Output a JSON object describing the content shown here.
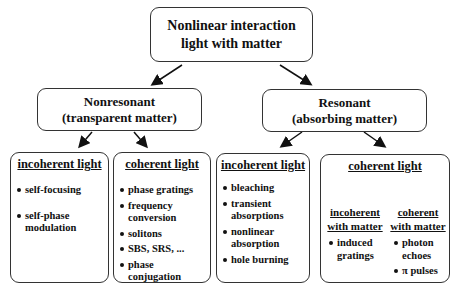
{
  "root": {
    "line1": "Nonlinear interaction",
    "line2": "light with matter"
  },
  "nonresonant": {
    "line1": "Nonresonant",
    "line2": "(transparent matter)"
  },
  "resonant": {
    "line1": "Resonant",
    "line2": "(absorbing matter)"
  },
  "nr_incoherent": {
    "title": "incoherent light",
    "items": [
      "self-focusing",
      "self-phase modulation"
    ]
  },
  "nr_coherent": {
    "title": "coherent light",
    "items": [
      "phase gratings",
      "frequency conversion",
      "solitons",
      "SBS, SRS, ...",
      "phase conjugation"
    ]
  },
  "r_incoherent": {
    "title": "incoherent light",
    "items": [
      "bleaching",
      "transient absorptions",
      "nonlinear absorption",
      "hole burning"
    ]
  },
  "r_coherent": {
    "title": "coherent light",
    "left": {
      "line1": "incoherent",
      "line2": "with matter",
      "items": [
        "induced gratings"
      ]
    },
    "right": {
      "line1": "coherent",
      "line2": "with matter",
      "items": [
        "photon echoes",
        "π pulses"
      ]
    }
  }
}
